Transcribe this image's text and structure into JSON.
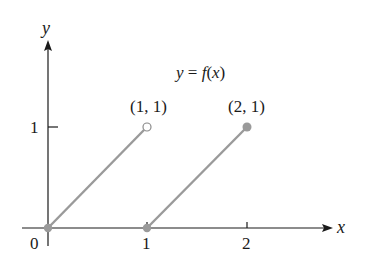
{
  "chart_data": {
    "type": "line",
    "title": "y = f(x)",
    "xlabel": "x",
    "ylabel": "y",
    "xlim": [
      0,
      2.9
    ],
    "ylim": [
      0,
      2.1
    ],
    "x_ticks": [
      "0",
      "1",
      "2"
    ],
    "y_ticks": [
      "1"
    ],
    "grid": false,
    "series": [
      {
        "name": "segment-1",
        "points": [
          [
            0,
            0
          ],
          [
            1,
            1
          ]
        ],
        "start_marker": "filled",
        "end_marker": "open"
      },
      {
        "name": "segment-2",
        "points": [
          [
            1,
            0
          ],
          [
            2,
            1
          ]
        ],
        "start_marker": "filled",
        "end_marker": "filled"
      }
    ],
    "annotations": [
      {
        "text": "(1, 1)",
        "x": 1,
        "y": 1
      },
      {
        "text": "(2, 1)",
        "x": 2,
        "y": 1
      },
      {
        "text": "y = f(x)",
        "x": 1.5,
        "y": 1.5
      }
    ]
  },
  "labels": {
    "x_axis": "x",
    "y_axis": "y",
    "origin": "0",
    "x_tick_1": "1",
    "x_tick_2": "2",
    "y_tick_1": "1",
    "point_a": "(1, 1)",
    "point_b": "(2, 1)",
    "func_y": "y",
    "func_eq": " = ",
    "func_f": "f",
    "func_paren": "(x)"
  },
  "colors": {
    "axis": "#1a1a1a",
    "curve": "#9a9a9a",
    "marker": "#9a9a9a"
  }
}
